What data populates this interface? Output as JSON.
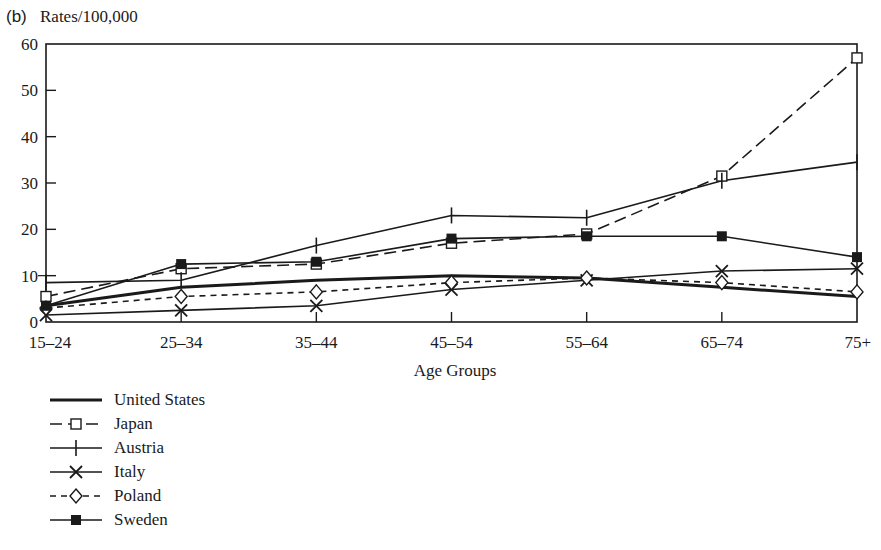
{
  "chart_data": {
    "type": "line",
    "panel_label": "(b)",
    "title": "",
    "ylabel": "Rates/100,000",
    "xlabel": "Age Groups",
    "ylim": [
      0,
      60
    ],
    "yticks": [
      0,
      10,
      20,
      30,
      40,
      50,
      60
    ],
    "grid": false,
    "legend_position": "below-left",
    "categories": [
      "15–24",
      "25–34",
      "35–44",
      "45–54",
      "55–64",
      "65–74",
      "75+"
    ],
    "series": [
      {
        "name": "United States",
        "style": "solid-thick",
        "marker": "none",
        "values": [
          3.5,
          7.5,
          9,
          10,
          9.5,
          7.5,
          5.5
        ]
      },
      {
        "name": "Japan",
        "style": "dashed",
        "marker": "open-square",
        "values": [
          5.5,
          11.5,
          12.5,
          17,
          19,
          31.5,
          57
        ]
      },
      {
        "name": "Austria",
        "style": "solid",
        "marker": "plus",
        "values": [
          8.5,
          9,
          16.5,
          23,
          22.5,
          30.5,
          34.5
        ]
      },
      {
        "name": "Italy",
        "style": "solid",
        "marker": "x",
        "values": [
          1.5,
          2.5,
          3.5,
          7,
          9,
          11,
          11.5
        ]
      },
      {
        "name": "Poland",
        "style": "dashed",
        "marker": "open-diamond",
        "values": [
          3,
          5.5,
          6.5,
          8.5,
          9.5,
          8.5,
          6.5
        ]
      },
      {
        "name": "Sweden",
        "style": "solid",
        "marker": "filled-square",
        "values": [
          3.5,
          12.5,
          13,
          18,
          18.5,
          18.5,
          14
        ]
      }
    ]
  },
  "legend": {
    "items": [
      {
        "label": "United States"
      },
      {
        "label": "Japan"
      },
      {
        "label": "Austria"
      },
      {
        "label": "Italy"
      },
      {
        "label": "Poland"
      },
      {
        "label": "Sweden"
      }
    ]
  },
  "colors": {
    "ink": "#1a1a1a",
    "background": "#ffffff"
  }
}
